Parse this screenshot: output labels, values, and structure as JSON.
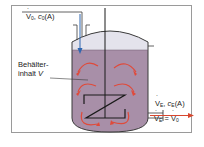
{
  "diagram": {
    "inlet": {
      "flow_symbol": "V",
      "flow_sub": "0",
      "conc_symbol": "c",
      "conc_sub": "0",
      "species": "(A)"
    },
    "vessel": {
      "label_line1": "Behälter-",
      "label_line2_text": "inhalt ",
      "label_line2_symbol": "V"
    },
    "outlet": {
      "flow_symbol": "V",
      "flow_sub": "E",
      "conc_symbol": "c",
      "conc_sub": "E",
      "species": "(A)",
      "equation_lhs_sub": "E",
      "equation_eq": " = ",
      "equation_rhs_sub": "0"
    },
    "colors": {
      "liquid": "#a88fa8",
      "headspace": "#e4e3ec",
      "vessel_outline": "#3a3a3a",
      "inlet_arrow": "#2f66b0",
      "outlet_arrow": "#d8472e",
      "flow_arrows": "#e04a3a",
      "frame": "#9a9a9a"
    }
  }
}
